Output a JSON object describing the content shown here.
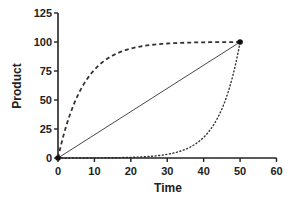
{
  "chart_data": {
    "type": "line",
    "title": "",
    "xlabel": "Time",
    "ylabel": "Product",
    "xlim": [
      0,
      60
    ],
    "ylim": [
      0,
      125
    ],
    "x_ticks": [
      0,
      10,
      20,
      30,
      40,
      50,
      60
    ],
    "y_ticks": [
      0,
      25,
      50,
      75,
      100,
      125
    ],
    "grid": false,
    "legend": null,
    "series": [
      {
        "name": "dashed (fast initial, saturating)",
        "style": "dashed",
        "x": [
          0,
          2.5,
          5,
          7.5,
          10,
          15,
          20,
          25,
          30,
          35,
          40,
          45,
          50
        ],
        "y": [
          0,
          30,
          51,
          66,
          76,
          88,
          94,
          97,
          98.5,
          99.3,
          99.6,
          99.8,
          100
        ]
      },
      {
        "name": "solid (linear)",
        "style": "solid",
        "x": [
          0,
          50
        ],
        "y": [
          0,
          100
        ]
      },
      {
        "name": "dotted (slow initial, accelerating)",
        "style": "dotted",
        "x": [
          0,
          10,
          20,
          25,
          30,
          35,
          40,
          42.5,
          45,
          47.5,
          50
        ],
        "y": [
          0,
          0.1,
          0.6,
          1.5,
          3,
          7,
          18,
          28,
          43,
          65,
          100
        ]
      }
    ],
    "markers": [
      {
        "x": 0,
        "y": 0
      },
      {
        "x": 50,
        "y": 100
      }
    ]
  },
  "colors": {
    "line": "#333333",
    "axis": "#222222"
  }
}
